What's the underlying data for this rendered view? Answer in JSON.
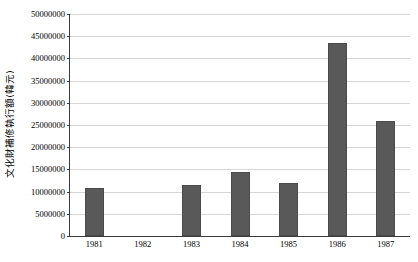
{
  "chart_data": {
    "type": "bar",
    "title": "",
    "subtitle": "",
    "xlabel": "",
    "ylabel": "文化財補修執行額(韓元)",
    "categories": [
      "1981",
      "1982",
      "1983",
      "1984",
      "1985",
      "1986",
      "1987"
    ],
    "values": [
      10800000,
      0,
      11500000,
      14400000,
      12000000,
      43500000,
      25900000
    ],
    "series": [
      {
        "name": "文化財補修執行額(韓元)",
        "values": [
          10800000,
          0,
          11500000,
          14400000,
          12000000,
          43500000,
          25900000
        ]
      }
    ],
    "ylim": [
      0,
      50000000
    ],
    "ytick_values": [
      0,
      5000000,
      10000000,
      15000000,
      20000000,
      25000000,
      30000000,
      35000000,
      40000000,
      45000000,
      50000000
    ],
    "ytick_labels": [
      "0",
      "5000000",
      "10000000",
      "15000000",
      "20000000",
      "25000000",
      "30000000",
      "35000000",
      "40000000",
      "45000000",
      "50000000"
    ],
    "grid": true,
    "grid_axis": "y",
    "legend": false,
    "legend_position": "none",
    "bar_color": "#595959",
    "gridline_color": "#d6d6d6",
    "axis_color": "#3c3c3c",
    "background_color": "#ffffff"
  }
}
